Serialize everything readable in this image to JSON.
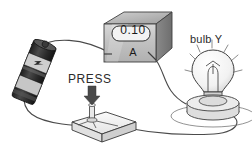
{
  "scene": {
    "title": "Series circuit with battery, ammeter, push switch and bulb",
    "background": "#ffffff",
    "ink": "#3a3a3a"
  },
  "ammeter": {
    "name": "ammeter",
    "reading": "0.10",
    "unit": "A",
    "display_shape": "rounded-rect",
    "body_color": "#c9c9c9",
    "top_color": "#b4b4b4",
    "side_color": "#7d7d7d"
  },
  "bulb": {
    "name": "bulb",
    "label": "bulb Y",
    "lit": true,
    "ray_count": 7,
    "glass_color": "#f4f4f4",
    "holder_color": "#d8d8d8"
  },
  "switch": {
    "name": "push-switch",
    "label": "PRESS",
    "arrow": "down-arrow",
    "base_color": "#ededed"
  },
  "battery": {
    "name": "battery-cell",
    "body_color": "#2e2e2e",
    "band_color": "#cfcfcf",
    "band_text": "SUPER"
  },
  "wires": {
    "battery_to_meter": "curved",
    "meter_to_bulb": "curved",
    "bulb_to_switch": "curved",
    "switch_to_battery": "curved",
    "color": "#4a4a4a"
  }
}
